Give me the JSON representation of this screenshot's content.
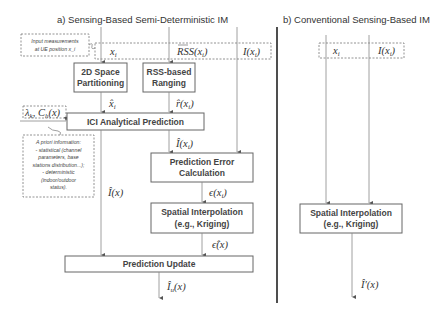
{
  "panel_a": {
    "title": "a) Sensing-Based Semi-Deterministic IM",
    "input_note": [
      "Input measurements",
      "at UE position x_i"
    ],
    "inputs": {
      "x": "x",
      "x_sub": "i",
      "rss": "RSS(x",
      "rss_close": ")",
      "I": "I(x",
      "I_close": ")"
    },
    "blocks": {
      "partitioning": [
        "2D Space",
        "Partitioning"
      ],
      "ranging": [
        "RSS-based",
        "Ranging"
      ],
      "ici": "ICI Analytical Prediction",
      "pred_error": [
        "Prediction Error",
        "Calculation"
      ],
      "spatial": [
        "Spatial Interpolation",
        "(e.g., Kriging)"
      ],
      "update": "Prediction Update"
    },
    "signals": {
      "x_hat": "x̂",
      "r_hat": "r̂(x",
      "lambda": "λ",
      "lambda_rest": ", C",
      "lambda_end": "(x)",
      "I_hat_xi": "Î(x",
      "I_hat_x": "Î(x)",
      "eps": "ϵ(x",
      "eps_hat": "ϵ̂(x)",
      "I_u": "Î",
      "I_u_end": "(x)"
    },
    "apriori_note": [
      "A priori information:",
      "- statistical (channel",
      "parameters, base",
      "stations distribution...);",
      "- deterministic",
      "(indoor/outdoor",
      "status)."
    ]
  },
  "panel_b": {
    "title": "b) Conventional Sensing-Based IM",
    "inputs": {
      "x": "x",
      "I": "I(x",
      "I_close": ")"
    },
    "blocks": {
      "spatial": [
        "Spatial Interpolation",
        "(e.g., Kriging)"
      ]
    },
    "output": "Î′(x)"
  }
}
